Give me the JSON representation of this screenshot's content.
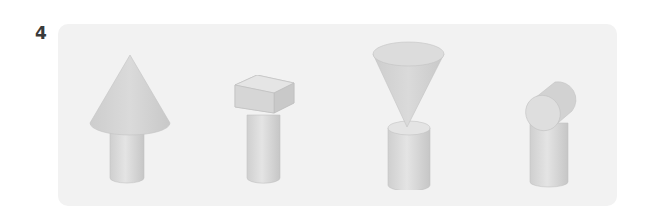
{
  "question": {
    "number": "4"
  },
  "panel": {
    "background": "#f2f2f2",
    "shapes": [
      {
        "id": "cone-on-cylinder",
        "description": "Cone sitting point-up on top of a cylinder"
      },
      {
        "id": "cuboid-on-cylinder",
        "description": "Rectangular block lying on top of a cylinder"
      },
      {
        "id": "inverted-cone-on-cylinder",
        "description": "Cone balanced point-down on top of a cylinder"
      },
      {
        "id": "tilted-cylinder-on-cylinder",
        "description": "Short cylinder lying on its side on top of a cylinder"
      }
    ]
  },
  "colors": {
    "shape_fill": "#d6d6d6",
    "shape_shade": "#c4c4c4",
    "shape_light": "#e6e6e6",
    "outline": "#bdbdbd"
  }
}
